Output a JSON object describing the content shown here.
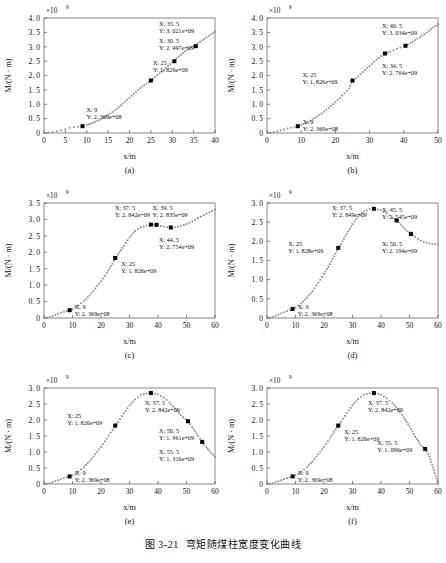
{
  "figure": {
    "caption_number": "图 3-21",
    "caption_text": "弯矩随煤柱宽度变化曲线",
    "exponent_label": "×10",
    "exponent_power": "9",
    "ylabel": "M/(N · m)",
    "xlabel": "x/m"
  },
  "chart_data": [
    {
      "type": "line",
      "panel": "(a)",
      "title": "",
      "xlabel": "x/m",
      "ylabel": "M/(N · m)",
      "xlim": [
        0,
        40
      ],
      "ylim": [
        0,
        4.0
      ],
      "y_scale": "1e9",
      "xticks": [
        0,
        5,
        10,
        15,
        20,
        25,
        30,
        35,
        40
      ],
      "xticklabels": [
        "0",
        "5",
        "10",
        "15",
        "20",
        "25",
        "30",
        "35",
        "40"
      ],
      "yticks": [
        0,
        0.5,
        1.0,
        1.5,
        2.0,
        2.5,
        3.0,
        3.5,
        4.0
      ],
      "yticklabels": [
        "0",
        "0. 5",
        "1. 0",
        "1. 5",
        "2. 0",
        "2. 5",
        "3. 0",
        "3. 5",
        "4. 0"
      ],
      "grid": false,
      "marker": "square",
      "series_color": "#8c8c8c",
      "x": [
        0,
        1,
        2,
        3,
        4,
        5,
        6,
        7,
        8,
        9,
        10,
        11,
        12,
        13,
        14,
        15,
        16,
        17,
        18,
        19,
        20,
        21,
        22,
        23,
        24,
        25,
        26,
        27,
        28,
        29,
        30,
        31,
        32,
        33,
        34,
        35,
        36,
        37,
        38,
        39,
        40
      ],
      "y": [
        0.0,
        0.012,
        0.03,
        0.055,
        0.09,
        0.13,
        0.175,
        0.2,
        0.22,
        0.237,
        0.28,
        0.33,
        0.39,
        0.46,
        0.54,
        0.63,
        0.73,
        0.84,
        0.96,
        1.09,
        1.23,
        1.37,
        1.5,
        1.62,
        1.72,
        1.826,
        1.95,
        2.07,
        2.19,
        2.33,
        2.46,
        2.6,
        2.72,
        2.84,
        2.95,
        3.021,
        3.12,
        3.22,
        3.32,
        3.43,
        3.52
      ],
      "annotations": [
        {
          "x": 9,
          "y": 0.2369,
          "x_label": "X: 9",
          "y_label": "Y: 2. 369e+08"
        },
        {
          "x": 25,
          "y": 1.826,
          "x_label": "X: 25",
          "y_label": "Y: 1. 826e+09"
        },
        {
          "x": 30.5,
          "y": 2.497,
          "x_label": "X: 30. 5",
          "y_label": "Y: 2. 497e+09"
        },
        {
          "x": 35.5,
          "y": 3.021,
          "x_label": "X: 35. 5",
          "y_label": "Y: 3. 021e+09"
        }
      ]
    },
    {
      "type": "line",
      "panel": "(b)",
      "title": "",
      "xlabel": "x/m",
      "ylabel": "M/(N · m)",
      "xlim": [
        0,
        50
      ],
      "ylim": [
        0,
        4.0
      ],
      "y_scale": "1e9",
      "xticks": [
        0,
        10,
        20,
        30,
        40,
        50
      ],
      "xticklabels": [
        "0",
        "10",
        "20",
        "30",
        "40",
        "50"
      ],
      "yticks": [
        0,
        0.5,
        1.0,
        1.5,
        2.0,
        2.5,
        3.0,
        3.5,
        4.0
      ],
      "yticklabels": [
        "0",
        "0. 5",
        "1. 0",
        "1. 5",
        "2. 0",
        "2. 5",
        "3. 0",
        "3. 5",
        "4. 0"
      ],
      "grid": false,
      "marker": "square",
      "series_color": "#8c8c8c",
      "x": [
        0,
        2,
        4,
        6,
        8,
        9,
        10,
        12,
        14,
        16,
        18,
        20,
        22,
        24,
        25,
        26,
        28,
        30,
        32,
        34,
        34.5,
        36,
        38,
        40,
        40.5,
        42,
        44,
        46,
        48,
        50
      ],
      "y": [
        0.0,
        0.03,
        0.09,
        0.16,
        0.21,
        0.237,
        0.27,
        0.38,
        0.52,
        0.68,
        0.87,
        1.07,
        1.3,
        1.55,
        1.826,
        1.9,
        2.12,
        2.33,
        2.55,
        2.74,
        2.764,
        2.83,
        2.93,
        3.01,
        3.034,
        3.13,
        3.28,
        3.44,
        3.62,
        3.78
      ],
      "annotations": [
        {
          "x": 9,
          "y": 0.2369,
          "x_label": "X: 9",
          "y_label": "Y: 2. 369e+08"
        },
        {
          "x": 25,
          "y": 1.826,
          "x_label": "X: 25",
          "y_label": "Y: 1. 826e+09"
        },
        {
          "x": 34.5,
          "y": 2.764,
          "x_label": "X: 34. 5",
          "y_label": "Y: 2. 764e+09"
        },
        {
          "x": 40.5,
          "y": 3.034,
          "x_label": "X: 40. 5",
          "y_label": "Y: 3. 034e+09"
        }
      ]
    },
    {
      "type": "line",
      "panel": "(c)",
      "title": "",
      "xlabel": "x/m",
      "ylabel": "M/(N · m)",
      "xlim": [
        0,
        60
      ],
      "ylim": [
        0,
        3.5
      ],
      "y_scale": "1e9",
      "xticks": [
        0,
        10,
        20,
        30,
        40,
        50,
        60
      ],
      "xticklabels": [
        "0",
        "10",
        "20",
        "30",
        "40",
        "50",
        "60"
      ],
      "yticks": [
        0,
        0.5,
        1.0,
        1.5,
        2.0,
        2.5,
        3.0,
        3.5
      ],
      "yticklabels": [
        "0",
        "0. 5",
        "1. 0",
        "1. 5",
        "2. 0",
        "2. 5",
        "3. 0",
        "3. 5"
      ],
      "grid": false,
      "marker": "square",
      "series_color": "#8c8c8c",
      "x": [
        0,
        2,
        4,
        6,
        8,
        9,
        10,
        12,
        14,
        16,
        18,
        20,
        22,
        24,
        25,
        26,
        28,
        30,
        32,
        34,
        36,
        37.5,
        39.5,
        41,
        42,
        44.5,
        46,
        48,
        50,
        52,
        54,
        56,
        58,
        60
      ],
      "y": [
        0.0,
        0.03,
        0.09,
        0.16,
        0.21,
        0.237,
        0.27,
        0.38,
        0.52,
        0.69,
        0.9,
        1.12,
        1.37,
        1.65,
        1.826,
        1.93,
        2.2,
        2.45,
        2.65,
        2.76,
        2.82,
        2.842,
        2.835,
        2.8,
        2.78,
        2.754,
        2.76,
        2.8,
        2.86,
        2.94,
        3.04,
        3.13,
        3.22,
        3.3
      ],
      "annotations": [
        {
          "x": 9,
          "y": 0.2369,
          "x_label": "X: 9",
          "y_label": "Y: 2. 369e+08"
        },
        {
          "x": 25,
          "y": 1.826,
          "x_label": "X: 25",
          "y_label": "Y: 1. 826e+09"
        },
        {
          "x": 37.5,
          "y": 2.842,
          "x_label": "X: 37. 5",
          "y_label": "Y: 2. 842e+09"
        },
        {
          "x": 39.5,
          "y": 2.835,
          "x_label": "X: 39. 5",
          "y_label": "Y: 2. 835e+09"
        },
        {
          "x": 44.5,
          "y": 2.754,
          "x_label": "X: 44. 5",
          "y_label": "Y: 2. 754e+09"
        }
      ]
    },
    {
      "type": "line",
      "panel": "(d)",
      "title": "",
      "xlabel": "x/m",
      "ylabel": "M/(N · m)",
      "xlim": [
        0,
        60
      ],
      "ylim": [
        0,
        3.0
      ],
      "y_scale": "1e9",
      "xticks": [
        0,
        10,
        20,
        30,
        40,
        50,
        60
      ],
      "xticklabels": [
        "0",
        "10",
        "20",
        "30",
        "40",
        "50",
        "60"
      ],
      "yticks": [
        0,
        0.5,
        1.0,
        1.5,
        2.0,
        2.5,
        3.0
      ],
      "yticklabels": [
        "0",
        "0. 5",
        "1. 0",
        "1. 5",
        "2. 0",
        "2. 5",
        "3. 0"
      ],
      "grid": false,
      "marker": "square",
      "series_color": "#8c8c8c",
      "x": [
        0,
        2,
        4,
        6,
        8,
        9,
        10,
        12,
        14,
        16,
        18,
        20,
        22,
        24,
        25,
        26,
        28,
        30,
        32,
        34,
        36,
        37.5,
        38,
        40,
        42,
        44,
        45.5,
        47,
        49,
        50.5,
        52,
        54,
        56,
        58,
        60
      ],
      "y": [
        0.0,
        0.03,
        0.09,
        0.15,
        0.21,
        0.237,
        0.27,
        0.38,
        0.53,
        0.7,
        0.92,
        1.15,
        1.4,
        1.68,
        1.828,
        1.93,
        2.2,
        2.45,
        2.64,
        2.78,
        2.84,
        2.849,
        2.85,
        2.82,
        2.73,
        2.62,
        2.545,
        2.44,
        2.27,
        2.194,
        2.11,
        2.02,
        1.96,
        1.93,
        1.92
      ],
      "annotations": [
        {
          "x": 9,
          "y": 0.2369,
          "x_label": "X: 9",
          "y_label": "Y: 2. 369e+08"
        },
        {
          "x": 25,
          "y": 1.828,
          "x_label": "X: 25",
          "y_label": "Y: 1. 828e+09"
        },
        {
          "x": 37.5,
          "y": 2.849,
          "x_label": "X: 37. 5",
          "y_label": "Y: 2. 849e+09"
        },
        {
          "x": 45.5,
          "y": 2.545,
          "x_label": "X: 45. 5",
          "y_label": "Y: 2. 545e+09"
        },
        {
          "x": 50.5,
          "y": 2.194,
          "x_label": "X: 50. 5",
          "y_label": "Y: 2. 194e+09"
        }
      ]
    },
    {
      "type": "line",
      "panel": "(e)",
      "title": "",
      "xlabel": "x/m",
      "ylabel": "M/(N · m)",
      "xlim": [
        0,
        60
      ],
      "ylim": [
        0,
        3.0
      ],
      "y_scale": "1e9",
      "xticks": [
        0,
        10,
        20,
        30,
        40,
        50,
        60
      ],
      "xticklabels": [
        "0",
        "10",
        "20",
        "30",
        "40",
        "50",
        "60"
      ],
      "yticks": [
        0,
        0.5,
        1.0,
        1.5,
        2.0,
        2.5,
        3.0
      ],
      "yticklabels": [
        "0",
        "0. 5",
        "1. 0",
        "1. 5",
        "2. 0",
        "2. 5",
        "3. 0"
      ],
      "grid": false,
      "marker": "square",
      "series_color": "#8c8c8c",
      "x": [
        0,
        2,
        4,
        6,
        8,
        9,
        10,
        12,
        14,
        16,
        18,
        20,
        22,
        24,
        25,
        26,
        28,
        30,
        32,
        34,
        36,
        37.5,
        38,
        40,
        42,
        44,
        46,
        48,
        50.5,
        52,
        54,
        55.5,
        57,
        58,
        60
      ],
      "y": [
        0.0,
        0.03,
        0.09,
        0.15,
        0.21,
        0.237,
        0.27,
        0.38,
        0.53,
        0.71,
        0.93,
        1.16,
        1.42,
        1.69,
        1.826,
        1.94,
        2.21,
        2.45,
        2.64,
        2.78,
        2.83,
        2.842,
        2.84,
        2.8,
        2.7,
        2.55,
        2.36,
        2.15,
        1.961,
        1.78,
        1.5,
        1.316,
        1.15,
        1.04,
        0.85
      ],
      "annotations": [
        {
          "x": 9,
          "y": 0.2369,
          "x_label": "X: 9",
          "y_label": "Y: 2. 369e+08"
        },
        {
          "x": 25,
          "y": 1.826,
          "x_label": "X: 25",
          "y_label": "Y: 1. 826e+09"
        },
        {
          "x": 37.5,
          "y": 2.842,
          "x_label": "X: 37. 5",
          "y_label": "Y: 2. 842e+09"
        },
        {
          "x": 50.5,
          "y": 1.961,
          "x_label": "X: 50. 5",
          "y_label": "Y: 1. 961e+09"
        },
        {
          "x": 55.5,
          "y": 1.316,
          "x_label": "X: 55. 5",
          "y_label": "Y: 1. 316e+09"
        }
      ]
    },
    {
      "type": "line",
      "panel": "(f)",
      "title": "",
      "xlabel": "x/m",
      "ylabel": "M/(N · m)",
      "xlim": [
        0,
        60
      ],
      "ylim": [
        0,
        3.0
      ],
      "y_scale": "1e9",
      "xticks": [
        0,
        10,
        20,
        30,
        40,
        50,
        60
      ],
      "xticklabels": [
        "0",
        "10",
        "20",
        "30",
        "40",
        "50",
        "60"
      ],
      "yticks": [
        0,
        0.5,
        1.0,
        1.5,
        2.0,
        2.5,
        3.0
      ],
      "yticklabels": [
        "0",
        "0. 5",
        "1. 0",
        "1. 5",
        "2. 0",
        "2. 5",
        "3. 0"
      ],
      "grid": false,
      "marker": "square",
      "series_color": "#8c8c8c",
      "x": [
        0,
        2,
        4,
        6,
        8,
        9,
        10,
        12,
        14,
        16,
        18,
        20,
        22,
        24,
        25,
        26,
        28,
        30,
        32,
        34,
        36,
        37.5,
        38,
        40,
        42,
        44,
        46,
        48,
        50,
        52,
        54,
        55.5,
        57,
        58,
        60
      ],
      "y": [
        0.0,
        0.03,
        0.09,
        0.15,
        0.21,
        0.237,
        0.27,
        0.38,
        0.53,
        0.71,
        0.93,
        1.16,
        1.42,
        1.7,
        1.826,
        1.95,
        2.22,
        2.46,
        2.65,
        2.79,
        2.84,
        2.842,
        2.84,
        2.79,
        2.68,
        2.53,
        2.33,
        2.08,
        1.8,
        1.48,
        1.2,
        1.096,
        0.85,
        0.6,
        0.0
      ],
      "annotations": [
        {
          "x": 9,
          "y": 0.2369,
          "x_label": "X: 9",
          "y_label": "Y: 2. 369e+08"
        },
        {
          "x": 25,
          "y": 1.826,
          "x_label": "X: 25",
          "y_label": "Y: 1. 826e+09"
        },
        {
          "x": 37.5,
          "y": 2.842,
          "x_label": "X: 37. 5",
          "y_label": "Y: 2. 842e+09"
        },
        {
          "x": 55.5,
          "y": 1.096,
          "x_label": "X: 55. 5",
          "y_label": "Y: 1. 096e+09"
        }
      ]
    }
  ],
  "annotation_offsets": [
    [
      {
        "dx": 4,
        "dy": -14
      },
      {
        "dx": 2,
        "dy": -16
      },
      {
        "dx": -8,
        "dy": -18
      },
      {
        "dx": -12,
        "dy": -20
      }
    ],
    [
      {
        "dx": 5,
        "dy": 8
      },
      {
        "dx": -50,
        "dy": -4
      },
      {
        "dx": 6,
        "dy": 14
      },
      {
        "dx": -6,
        "dy": -18
      }
    ],
    [
      {
        "dx": 5,
        "dy": 10
      },
      {
        "dx": 6,
        "dy": 8
      },
      {
        "dx": -36,
        "dy": -16
      },
      {
        "dx": -4,
        "dy": -22
      },
      {
        "dx": 6,
        "dy": 14
      }
    ],
    [
      {
        "dx": 5,
        "dy": 10
      },
      {
        "dx": -50,
        "dy": -2
      },
      {
        "dx": -42,
        "dy": -14
      },
      {
        "dx": 6,
        "dy": -8
      },
      {
        "dx": 2,
        "dy": 12
      }
    ],
    [
      {
        "dx": 5,
        "dy": 10
      },
      {
        "dx": -48,
        "dy": -8
      },
      {
        "dx": -6,
        "dy": 12
      },
      {
        "dx": -10,
        "dy": 12
      },
      {
        "dx": -38,
        "dy": 12
      }
    ],
    [
      {
        "dx": 5,
        "dy": 10
      },
      {
        "dx": 6,
        "dy": 8
      },
      {
        "dx": -6,
        "dy": 12
      },
      {
        "dx": -48,
        "dy": -4
      }
    ]
  ]
}
